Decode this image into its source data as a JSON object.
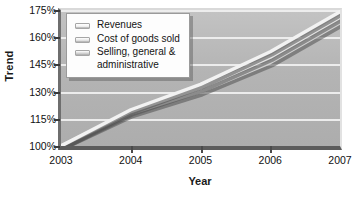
{
  "chart_data": {
    "type": "line",
    "title": "",
    "xlabel": "Year",
    "ylabel": "Trend",
    "x": [
      2003,
      2004,
      2005,
      2006,
      2007
    ],
    "xtick_labels": [
      "2003",
      "2004",
      "2005",
      "2006",
      "2007"
    ],
    "ytick_labels": [
      "100%",
      "115%",
      "130%",
      "145%",
      "160%",
      "175%"
    ],
    "ytick_values": [
      100,
      115,
      130,
      145,
      160,
      175
    ],
    "ylim": [
      100,
      175
    ],
    "xlim": [
      2003,
      2007
    ],
    "grid": true,
    "legend_position": "top-left",
    "series": [
      {
        "name": "Revenues",
        "color": "#f2f2f2",
        "values": [
          100,
          120,
          134,
          152,
          174
        ]
      },
      {
        "name": "Cost of goods sold",
        "color": "#e4e4e4",
        "values": [
          100,
          119,
          132,
          149,
          171
        ]
      },
      {
        "name": "Selling, general &\nadministrative",
        "color": "#d2d2d2",
        "values": [
          100,
          118,
          130,
          146,
          168
        ]
      }
    ]
  },
  "axes": {
    "y_title": "Trend",
    "x_title": "Year"
  },
  "legend": {
    "items": [
      {
        "label": "Revenues"
      },
      {
        "label": "Cost of goods sold"
      },
      {
        "label": "Selling, general &\nadministrative"
      }
    ]
  },
  "colors": {
    "plot_background": "#b6b6b6",
    "gridline": "#f1f1f1",
    "axis": "#5c5c5c",
    "page_background": "#ffffff"
  }
}
